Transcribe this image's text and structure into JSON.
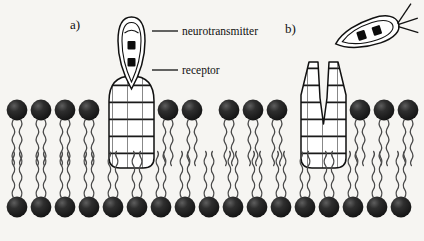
{
  "figure": {
    "background_color": "#f6f5f2",
    "ink_color": "#111111",
    "panels": [
      {
        "id": "a",
        "label": "a)",
        "state": "bound",
        "description": "neurotransmitter docked into receptor binding site"
      },
      {
        "id": "b",
        "label": "b)",
        "state": "unbound",
        "description": "neurotransmitter released, receptor binding cleft open"
      }
    ],
    "callouts": [
      {
        "id": "neurotransmitter",
        "label": "neurotransmitter",
        "leader_from_x": 152,
        "leader_to_x": 178,
        "leader_y": 31
      },
      {
        "id": "receptor",
        "label": "receptor",
        "leader_from_x": 152,
        "leader_to_x": 178,
        "leader_y": 70
      }
    ],
    "membrane": {
      "head_color": "#1c1c1c",
      "highlight_color": "#6a6a6a",
      "upper_leaflet_count": 12,
      "lower_leaflet_count": 16,
      "tails_per_lipid": 2
    },
    "receptors": [
      {
        "panel": "a",
        "fill": "#ffffff",
        "pattern": "brick",
        "brick_rows": 9,
        "top_shape": "closed-rounded",
        "x": 108,
        "width": 46
      },
      {
        "panel": "b",
        "fill": "#ffffff",
        "pattern": "brick",
        "brick_rows": 9,
        "top_shape": "open-cleft",
        "x": 300,
        "width": 46
      }
    ],
    "ligands": [
      {
        "panel": "a",
        "orientation": "vertical",
        "shape": "teardrop",
        "dot_count": 2,
        "tail_lines": 0
      },
      {
        "panel": "b",
        "orientation": "tilted",
        "shape": "lens",
        "dot_count": 2,
        "tail_lines": 3
      }
    ]
  }
}
